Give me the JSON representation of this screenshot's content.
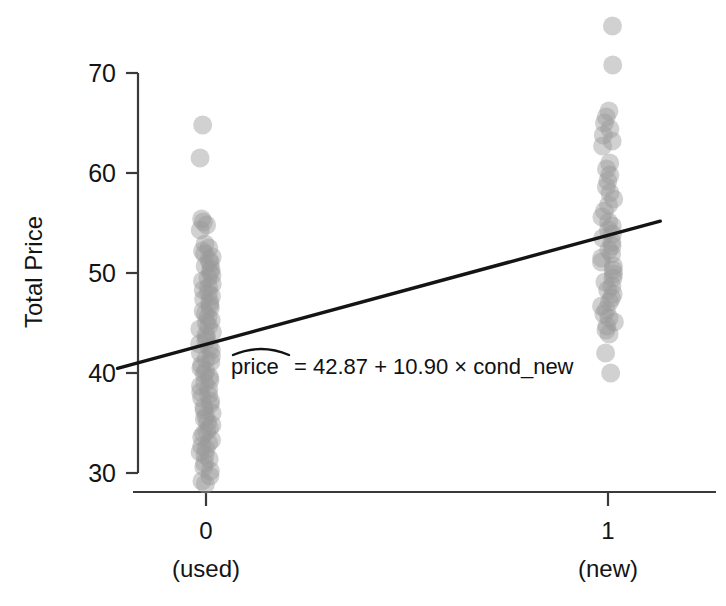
{
  "figure": {
    "background": "#ffffff",
    "point_color": "#9a9a9a",
    "point_opacity": 0.45,
    "line_color": "#141414",
    "axis_color": "#3a3a3a"
  },
  "annotation": {
    "equation_lhs": "price",
    "equation_rhs": "= 42.87 + 10.90 × cond_new",
    "equation_full": "pricê = 42.87 + 10.90 × cond_new"
  },
  "chart_data": {
    "type": "scatter",
    "title": "",
    "xlabel": "",
    "ylabel": "Total Price",
    "xlim": [
      -0.3,
      1.3
    ],
    "ylim": [
      27.5,
      76.0
    ],
    "x_ticks": [
      0,
      1
    ],
    "x_tick_labels": [
      "0",
      "1"
    ],
    "x_tick_sublabels": [
      "(used)",
      "(new)"
    ],
    "y_ticks": [
      30,
      40,
      50,
      60,
      70
    ],
    "y_tick_labels": [
      "30",
      "40",
      "50",
      "60",
      "70"
    ],
    "grid": false,
    "legend": null,
    "jitter": true,
    "series": [
      {
        "name": "cond_new = 0 (used)",
        "x": 0,
        "values": [
          64.8,
          61.5,
          55.4,
          55.1,
          54.8,
          54.3,
          52.9,
          52.5,
          52.2,
          51.9,
          51.6,
          51.3,
          51.0,
          50.7,
          50.4,
          50.1,
          49.8,
          49.5,
          49.2,
          48.9,
          48.6,
          48.3,
          48.0,
          47.7,
          47.4,
          47.1,
          46.8,
          46.5,
          46.2,
          45.9,
          45.6,
          45.3,
          45.0,
          44.7,
          44.4,
          44.1,
          43.8,
          43.5,
          43.2,
          42.9,
          42.6,
          42.3,
          42.0,
          41.7,
          41.4,
          41.1,
          40.8,
          40.5,
          40.2,
          39.9,
          39.6,
          39.3,
          39.0,
          38.7,
          38.4,
          38.1,
          37.8,
          37.5,
          37.2,
          36.9,
          36.6,
          36.3,
          36.0,
          35.7,
          35.4,
          35.1,
          34.8,
          34.5,
          34.2,
          33.9,
          33.6,
          33.3,
          33.0,
          32.7,
          32.4,
          32.1,
          31.8,
          31.4,
          31.0,
          30.6,
          30.2,
          29.7,
          29.2,
          28.9
        ]
      },
      {
        "name": "cond_new = 1 (new)",
        "x": 1,
        "values": [
          74.7,
          70.8,
          66.2,
          65.6,
          65.0,
          64.4,
          63.8,
          63.2,
          62.7,
          61.0,
          60.4,
          59.8,
          59.2,
          58.6,
          58.0,
          57.4,
          56.8,
          56.2,
          55.6,
          55.1,
          54.7,
          54.3,
          53.9,
          53.5,
          53.1,
          52.7,
          52.3,
          51.9,
          51.5,
          51.1,
          50.7,
          50.3,
          49.9,
          49.5,
          49.1,
          48.7,
          48.3,
          47.9,
          47.5,
          47.1,
          46.7,
          46.3,
          45.9,
          45.5,
          45.1,
          44.7,
          44.3,
          43.9,
          42.0,
          40.0
        ]
      }
    ],
    "regression_line": {
      "intercept": 42.87,
      "slope": 10.9,
      "x_start": -0.22,
      "x_end": 1.13,
      "y_start": 40.47,
      "y_end": 55.19
    }
  }
}
